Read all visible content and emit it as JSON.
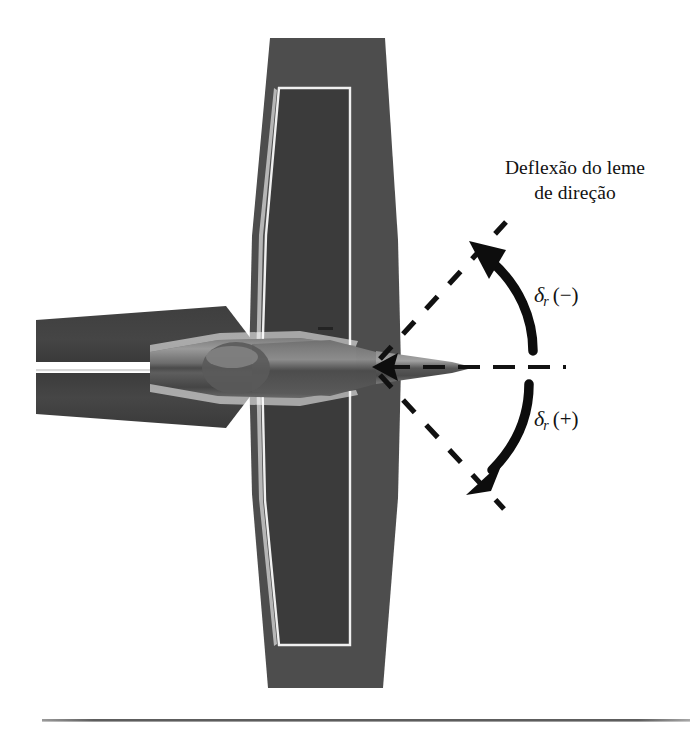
{
  "figure": {
    "kind": "technical-diagram",
    "caption": {
      "line1": "Deflexão do leme",
      "line2": "de direção"
    },
    "annotations": [
      {
        "id": "delta-r-negative",
        "symbol": "δ",
        "subscript": "r",
        "sign": "(−)",
        "meaning": "rudder deflection negative",
        "position": "upper-right"
      },
      {
        "id": "delta-r-positive",
        "symbol": "δ",
        "subscript": "r",
        "sign": "(+)",
        "meaning": "rudder deflection positive",
        "position": "lower-right"
      }
    ],
    "colors": {
      "fin_fill": "#4f4f4f",
      "rudder_fill": "#3a3a3a",
      "stabilizer_fill": "#3e3e3e",
      "fuselage_light": "#8a8a8a",
      "fuselage_mid": "#666666",
      "fuselage_dark": "#3c3c3c",
      "outline_white": "#f2f2f2",
      "ink": "#121212",
      "rule": "#6e6e6e",
      "background": "#ffffff"
    },
    "geometry": {
      "pivot_x": 378,
      "pivot_y": 367,
      "centerline_end_x": 566,
      "ray_angle_deg": 37,
      "ray_length": 152
    }
  }
}
